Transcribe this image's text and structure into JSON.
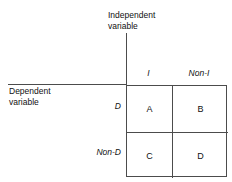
{
  "diagram": {
    "column_axis": {
      "title_line1": "Independent",
      "title_line2": "variable",
      "headers": [
        "I",
        "Non-I"
      ]
    },
    "row_axis": {
      "title_line1": "Dependent",
      "title_line2": "variable",
      "headers": [
        "D",
        "Non-D"
      ]
    },
    "cells": [
      [
        "A",
        "B"
      ],
      [
        "C",
        "D"
      ]
    ],
    "colors": {
      "line": "#4c4c4c",
      "text": "#111111",
      "background": "#ffffff"
    }
  }
}
